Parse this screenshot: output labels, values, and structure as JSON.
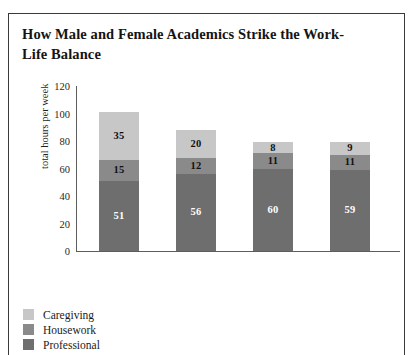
{
  "figure": {
    "title": "How Male and Female Academics Strike the Work-Life Balance"
  },
  "chart_data": {
    "type": "bar",
    "subtype": "stacked-vertical",
    "title": "How Male and Female Academics Strike the Work-Life Balance",
    "xlabel": "",
    "ylabel": "total hours per week",
    "ylim": [
      0,
      120
    ],
    "yticks": [
      0,
      20,
      40,
      60,
      80,
      100,
      120
    ],
    "grid": false,
    "legend_position": "bottom-left",
    "categories": [
      "Women with children",
      "Men with children",
      "Women without children",
      "Men without children"
    ],
    "category_lines": [
      [
        "Women",
        "with",
        "children"
      ],
      [
        "Men with",
        "children"
      ],
      [
        "Women",
        "without",
        "children"
      ],
      [
        "Men",
        "without",
        "children"
      ]
    ],
    "series": [
      {
        "name": "Professional",
        "color": "#6e6e6e",
        "label_color": "#ffffff",
        "values": [
          51,
          56,
          60,
          59
        ]
      },
      {
        "name": "Housework",
        "color": "#8a8a8a",
        "label_color": "#111111",
        "values": [
          15,
          12,
          11,
          11
        ]
      },
      {
        "name": "Caregiving",
        "color": "#c7c7c7",
        "label_color": "#111111",
        "values": [
          35,
          20,
          8,
          9
        ]
      }
    ],
    "totals": [
      101,
      88,
      79,
      79
    ],
    "legend_entries": [
      {
        "label": "Caregiving",
        "color": "#c7c7c7"
      },
      {
        "label": "Housework",
        "color": "#8a8a8a"
      },
      {
        "label": "Professional",
        "color": "#6e6e6e"
      }
    ]
  }
}
